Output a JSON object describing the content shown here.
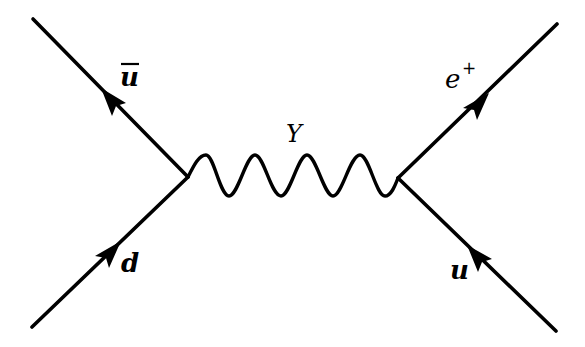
{
  "diagram": {
    "type": "feynman-diagram",
    "colors": {
      "line": "#000000",
      "background": "#ffffff"
    },
    "vertices": [
      {
        "id": "left-vertex",
        "x": 188,
        "y": 177
      },
      {
        "id": "right-vertex",
        "x": 398,
        "y": 178
      }
    ],
    "particles": [
      {
        "id": "anti-up-quark",
        "label_main": "u",
        "label_mod": "bar",
        "from": [
          33,
          19
        ],
        "to": [
          188,
          177
        ],
        "arrow_direction": "toward-outer"
      },
      {
        "id": "down-quark",
        "label_main": "d",
        "label_mod": "",
        "from": [
          32,
          327
        ],
        "to": [
          188,
          177
        ],
        "arrow_direction": "toward-vertex"
      },
      {
        "id": "positron",
        "label_main": "e",
        "label_mod": "+",
        "from": [
          398,
          178
        ],
        "to": [
          557,
          24
        ],
        "arrow_direction": "toward-outer"
      },
      {
        "id": "up-quark",
        "label_main": "u",
        "label_mod": "",
        "from": [
          556,
          331
        ],
        "to": [
          398,
          178
        ],
        "arrow_direction": "toward-vertex"
      }
    ],
    "propagator": {
      "id": "Y-boson",
      "label": "Y",
      "style": "wavy",
      "peaks": 4
    },
    "labels": {
      "ubar": {
        "main": "u",
        "bar": "‾"
      },
      "d": "d",
      "eplus": {
        "main": "e",
        "sup": "+"
      },
      "u": "u",
      "Y": "Y"
    }
  }
}
